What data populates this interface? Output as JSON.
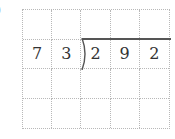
{
  "problem": {
    "label_partial": ")",
    "divisor": "73",
    "dividend": "292"
  },
  "grid": {
    "rows": 4,
    "cols": 5,
    "cells": [
      [
        "",
        "",
        "",
        "",
        ""
      ],
      [
        "7",
        "3",
        "2",
        "9",
        "2"
      ],
      [
        "",
        "",
        "",
        "",
        ""
      ],
      [
        "",
        "",
        "",
        "",
        ""
      ]
    ]
  },
  "colors": {
    "grid_line": "#b8b8b8",
    "text": "#333333",
    "division_line": "#555555"
  }
}
